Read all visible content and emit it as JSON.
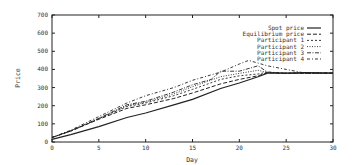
{
  "chart_data": {
    "type": "line",
    "title": "",
    "xlabel": "Day",
    "ylabel": "Price",
    "xlim": [
      0,
      30
    ],
    "ylim": [
      0,
      700
    ],
    "xticks": [
      0,
      5,
      10,
      15,
      20,
      25,
      30
    ],
    "yticks": [
      0,
      100,
      200,
      300,
      400,
      500,
      600,
      700
    ],
    "xtick_labels": [
      "0",
      "5",
      "10",
      "15",
      "20",
      "25",
      "30"
    ],
    "ytick_labels": [
      "0",
      "100",
      "200",
      "300",
      "400",
      "500",
      "600",
      "700"
    ],
    "grid": false,
    "legend_position": "top-right",
    "series": [
      {
        "name": "Spot price",
        "style": "solid",
        "x": [
          0,
          2,
          5,
          8,
          10,
          13,
          15,
          18,
          20,
          22,
          23,
          25,
          27,
          30
        ],
        "values": [
          15,
          40,
          85,
          135,
          160,
          205,
          235,
          295,
          325,
          360,
          380,
          380,
          382,
          380
        ]
      },
      {
        "name": "Equilibrium price",
        "style": "dashed",
        "x": [
          0,
          2,
          5,
          8,
          10,
          13,
          15,
          18,
          20,
          22,
          23,
          25,
          27,
          30
        ],
        "values": [
          25,
          60,
          125,
          185,
          205,
          240,
          270,
          320,
          345,
          365,
          382,
          378,
          380,
          380
        ]
      },
      {
        "name": "Participant 1",
        "style": "short-dashed",
        "x": [
          0,
          2,
          5,
          8,
          10,
          13,
          15,
          18,
          20,
          22,
          23,
          25,
          27,
          30
        ],
        "values": [
          25,
          60,
          128,
          195,
          215,
          255,
          290,
          345,
          365,
          375,
          385,
          380,
          380,
          380
        ]
      },
      {
        "name": "Participant 2",
        "style": "dotted",
        "x": [
          0,
          2,
          5,
          8,
          10,
          13,
          15,
          18,
          20,
          22,
          23,
          25,
          27,
          30
        ],
        "values": [
          25,
          62,
          130,
          200,
          220,
          265,
          305,
          360,
          378,
          395,
          383,
          380,
          380,
          380
        ]
      },
      {
        "name": "Participant 3",
        "style": "dash-dash-dot",
        "x": [
          0,
          2,
          5,
          8,
          10,
          13,
          15,
          17,
          18,
          20,
          22,
          23,
          25,
          27,
          30
        ],
        "values": [
          25,
          62,
          130,
          205,
          225,
          275,
          315,
          345,
          390,
          390,
          420,
          385,
          378,
          380,
          380
        ]
      },
      {
        "name": "Participant 4",
        "style": "dash-dot",
        "x": [
          0,
          2,
          5,
          8,
          10,
          13,
          15,
          18,
          20,
          21,
          23,
          25,
          26,
          27,
          30
        ],
        "values": [
          25,
          65,
          140,
          215,
          255,
          300,
          340,
          385,
          430,
          450,
          420,
          400,
          390,
          380,
          380
        ]
      }
    ]
  }
}
